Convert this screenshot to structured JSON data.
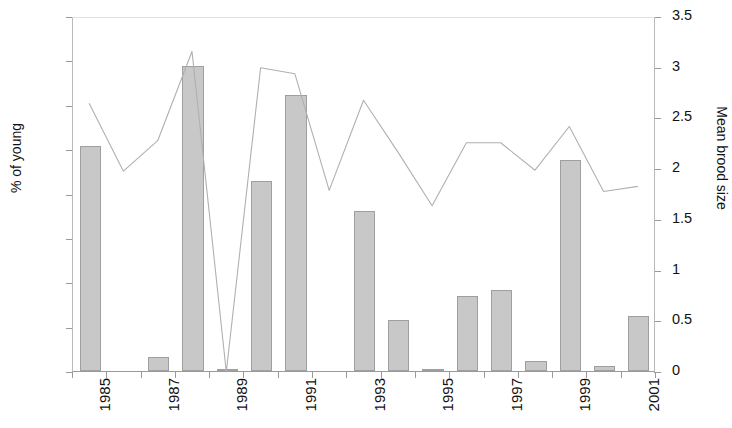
{
  "chart_data": {
    "type": "bar",
    "title": "",
    "xlabel": "",
    "ylabel": "% of young",
    "y2label": "Mean brood size",
    "grid": false,
    "legend": "none",
    "x": [
      1985,
      1986,
      1987,
      1988,
      1989,
      1990,
      1991,
      1992,
      1993,
      1994,
      1995,
      1996,
      1997,
      1998,
      1999,
      2000,
      2001
    ],
    "categories": [
      "1985",
      "1986",
      "1987",
      "1988",
      "1989",
      "1990",
      "1991",
      "1992",
      "1993",
      "1994",
      "1995",
      "1996",
      "1997",
      "1998",
      "1999",
      "2000",
      "2001"
    ],
    "xtick_labels": [
      "1985",
      "1987",
      "1989",
      "1991",
      "1993",
      "1995",
      "1997",
      "1999",
      "2001"
    ],
    "ylim": [
      0,
      40
    ],
    "yticks": [
      "0",
      "5",
      "10",
      "15",
      "20",
      "25",
      "30",
      "35",
      "40"
    ],
    "y2lim": [
      0,
      3.5
    ],
    "y2ticks": [
      "0",
      "0.5",
      "1",
      "1.5",
      "2",
      "2.5",
      "3",
      "3.5"
    ],
    "series": [
      {
        "name": "% of young",
        "type": "bar",
        "axis": "left",
        "color": "#c8c8c8",
        "values": [
          25.4,
          0.0,
          1.6,
          34.4,
          0.2,
          21.4,
          31.1,
          0.0,
          18.0,
          5.8,
          0.2,
          8.4,
          9.1,
          1.1,
          23.8,
          0.6,
          6.2
        ]
      },
      {
        "name": "Mean brood size",
        "type": "line",
        "axis": "right",
        "color": "#b0b0b0",
        "values": [
          2.65,
          1.98,
          2.28,
          3.16,
          0.0,
          3.0,
          2.94,
          1.79,
          2.68,
          2.17,
          1.64,
          2.26,
          2.26,
          1.99,
          2.42,
          1.78,
          1.83
        ]
      }
    ]
  }
}
